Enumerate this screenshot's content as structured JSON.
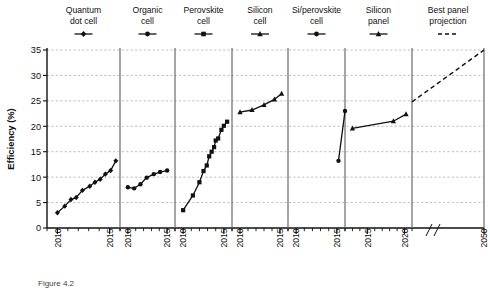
{
  "figure": {
    "ylabel": "Efficiency (%)",
    "caption": "Figure 4.2"
  },
  "axes": {
    "y_ticks": [
      "0",
      "5",
      "10",
      "15",
      "20",
      "25",
      "30",
      "35"
    ],
    "y_values": [
      0,
      5,
      10,
      15,
      20,
      25,
      30,
      35
    ],
    "ylim": [
      0,
      35
    ],
    "grid": "horizontal-dashed",
    "axis_break_symbol": "//"
  },
  "panels": [
    {
      "title_line1": "Quantum",
      "title_line2": "dot cell",
      "marker": "diamond-icon",
      "x_ticks": [
        "2010",
        "2015"
      ],
      "x_range": [
        2009,
        2016
      ]
    },
    {
      "title_line1": "Organic",
      "title_line2": "cell",
      "marker": "circle-icon",
      "x_ticks": [
        "2010",
        "2015"
      ],
      "x_range": [
        2009,
        2016
      ]
    },
    {
      "title_line1": "Perovskite",
      "title_line2": "cell",
      "marker": "square-icon",
      "x_ticks": [
        "2010",
        "2015"
      ],
      "x_range": [
        2009,
        2016
      ]
    },
    {
      "title_line1": "Silicon",
      "title_line2": "cell",
      "marker": "triangle-icon",
      "x_ticks": [
        "2010",
        "2015"
      ],
      "x_range": [
        2009,
        2016
      ]
    },
    {
      "title_line1": "Si/perovskite",
      "title_line2": "cell",
      "marker": "circle-icon",
      "x_ticks": [
        "2010",
        "2015"
      ],
      "x_range": [
        2009,
        2016
      ]
    },
    {
      "title_line1": "Silicon",
      "title_line2": "panel",
      "marker": "triangle-icon",
      "x_ticks": [
        "2015",
        "2020"
      ],
      "x_range": [
        2012,
        2021
      ]
    },
    {
      "title_line1": "Best panel",
      "title_line2": "projection",
      "marker": "dashed-line-icon",
      "x_ticks": [
        "2050"
      ],
      "x_range": [
        2020,
        2050
      ]
    }
  ],
  "chart_data": {
    "type": "line",
    "title": "",
    "xlabel": "",
    "ylabel": "Efficiency (%)",
    "ylim": [
      0,
      35
    ],
    "grid": true,
    "legend_position": "top",
    "series": [
      {
        "name": "Quantum dot cell",
        "marker": "diamond",
        "x": [
          2010,
          2010.7,
          2011.3,
          2011.8,
          2012.4,
          2013.1,
          2013.6,
          2014.1,
          2014.6,
          2015.1,
          2015.6
        ],
        "values": [
          3.0,
          4.3,
          5.6,
          6.0,
          7.4,
          8.2,
          9.0,
          9.6,
          10.6,
          11.3,
          13.2
        ]
      },
      {
        "name": "Organic cell",
        "marker": "circle",
        "x": [
          2010,
          2010.8,
          2011.6,
          2012.4,
          2013.3,
          2014.1,
          2015.0
        ],
        "values": [
          8.0,
          7.8,
          8.6,
          9.9,
          10.6,
          11.0,
          11.3
        ]
      },
      {
        "name": "Perovskite cell",
        "marker": "square",
        "x": [
          2010,
          2011.2,
          2012.0,
          2012.5,
          2012.9,
          2013.2,
          2013.5,
          2013.8,
          2014.0,
          2014.3,
          2014.7,
          2015.0,
          2015.4
        ],
        "values": [
          3.5,
          6.4,
          9.0,
          11.2,
          12.3,
          14.1,
          15.0,
          15.9,
          17.2,
          17.6,
          19.3,
          20.1,
          20.9
        ]
      },
      {
        "name": "Silicon cell",
        "marker": "triangle",
        "x": [
          2010,
          2011.5,
          2013.0,
          2014.3,
          2015.2
        ],
        "values": [
          22.8,
          23.2,
          24.2,
          25.3,
          26.4
        ]
      },
      {
        "name": "Si/perovskite cell",
        "marker": "circle",
        "x": [
          2015.2,
          2016.0
        ],
        "values": [
          13.2,
          23.0
        ]
      },
      {
        "name": "Silicon panel",
        "marker": "triangle",
        "x": [
          2013.0,
          2018.5,
          2020.2
        ],
        "values": [
          19.6,
          21.0,
          22.4
        ]
      },
      {
        "name": "Best panel projection",
        "marker": "none",
        "style": "dashed",
        "x": [
          2020,
          2050
        ],
        "values": [
          24.8,
          35.0
        ]
      }
    ]
  }
}
